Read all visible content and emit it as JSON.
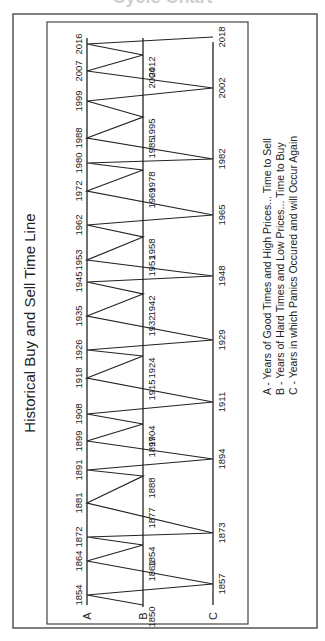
{
  "top_title": "Cycle Chart",
  "chart_data": {
    "type": "line",
    "title": "Historical Buy and Sell Time Line",
    "orientation": "rotated 90deg counter-clockwise",
    "lines": [
      {
        "key": "A",
        "label": "A",
        "description": "A - Years of Good Times and High Prices... Time to Sell"
      },
      {
        "key": "B",
        "label": "B",
        "description": "B - Years of Hard Times and Low Prices... Time to Buy"
      },
      {
        "key": "C",
        "label": "C",
        "description": "C - Years in which Panics Occured and will Occur Again"
      }
    ],
    "A_years": [
      1854,
      1864,
      1872,
      1881,
      1891,
      1899,
      1908,
      1918,
      1926,
      1935,
      1945,
      1953,
      1962,
      1972,
      1980,
      1988,
      1999,
      2007,
      2016
    ],
    "B_years": [
      1850,
      1861,
      1854,
      1877,
      1888,
      1897,
      1904,
      1915,
      1924,
      1932,
      1942,
      1951,
      1958,
      1969,
      1978,
      1985,
      1995,
      2004,
      2012
    ],
    "C_years": [
      1857,
      1873,
      1894,
      1911,
      1929,
      1948,
      1965,
      1982,
      2002,
      2018
    ],
    "zigzag_path": [
      {
        "line": "B",
        "year": 1850,
        "pos": 605
      },
      {
        "line": "A",
        "year": 1854,
        "pos": 595
      },
      {
        "line": "C",
        "year": 1857,
        "pos": 584
      },
      {
        "line": "A",
        "year": 1864,
        "pos": 561
      },
      {
        "line": "B",
        "year": 1854,
        "pos": 545
      },
      {
        "line": "A",
        "year": 1872,
        "pos": 537
      },
      {
        "line": "C",
        "year": 1873,
        "pos": 533
      },
      {
        "line": "A",
        "year": 1881,
        "pos": 503
      },
      {
        "line": "B",
        "year": 1888,
        "pos": 476
      },
      {
        "line": "A",
        "year": 1891,
        "pos": 470
      },
      {
        "line": "C",
        "year": 1894,
        "pos": 459
      },
      {
        "line": "A",
        "year": 1899,
        "pos": 441
      },
      {
        "line": "B",
        "year": 1904,
        "pos": 424
      },
      {
        "line": "A",
        "year": 1908,
        "pos": 414
      },
      {
        "line": "C",
        "year": 1911,
        "pos": 402
      },
      {
        "line": "A",
        "year": 1918,
        "pos": 378
      },
      {
        "line": "B",
        "year": 1924,
        "pos": 356
      },
      {
        "line": "A",
        "year": 1926,
        "pos": 350
      },
      {
        "line": "C",
        "year": 1929,
        "pos": 340
      },
      {
        "line": "A",
        "year": 1935,
        "pos": 316
      },
      {
        "line": "B",
        "year": 1942,
        "pos": 294
      },
      {
        "line": "A",
        "year": 1945,
        "pos": 282
      },
      {
        "line": "C",
        "year": 1948,
        "pos": 276
      },
      {
        "line": "A",
        "year": 1953,
        "pos": 260
      },
      {
        "line": "B",
        "year": 1958,
        "pos": 237
      },
      {
        "line": "A",
        "year": 1962,
        "pos": 225
      },
      {
        "line": "C",
        "year": 1965,
        "pos": 215
      },
      {
        "line": "A",
        "year": 1972,
        "pos": 191
      },
      {
        "line": "B",
        "year": 1978,
        "pos": 170
      },
      {
        "line": "A",
        "year": 1980,
        "pos": 163
      },
      {
        "line": "C",
        "year": 1982,
        "pos": 159
      },
      {
        "line": "A",
        "year": 1988,
        "pos": 138
      },
      {
        "line": "B",
        "year": 1995,
        "pos": 117
      },
      {
        "line": "A",
        "year": 1999,
        "pos": 101
      },
      {
        "line": "C",
        "year": 2002,
        "pos": 88
      },
      {
        "line": "A",
        "year": 2007,
        "pos": 71
      },
      {
        "line": "B",
        "year": 2012,
        "pos": 55
      },
      {
        "line": "A",
        "year": 2016,
        "pos": 44
      },
      {
        "line": "C",
        "year": 2018,
        "pos": 37
      }
    ],
    "crossing_labels_B": [
      {
        "year": 1861,
        "pos": 571
      },
      {
        "year": 1877,
        "pos": 518
      },
      {
        "year": 1897,
        "pos": 447
      },
      {
        "year": 1915,
        "pos": 390
      },
      {
        "year": 1932,
        "pos": 326
      },
      {
        "year": 1951,
        "pos": 266
      },
      {
        "year": 1969,
        "pos": 198
      },
      {
        "year": 1985,
        "pos": 148
      },
      {
        "year": 2004,
        "pos": 78
      }
    ],
    "legend_position": "bottom-right (rotated)",
    "grid": false
  },
  "colors": {
    "line": "#222222",
    "frame": "#555555",
    "background": "#ffffff",
    "top_title": "#cfcfcf"
  }
}
